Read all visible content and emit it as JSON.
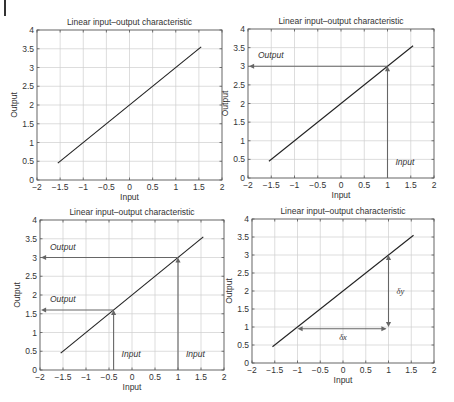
{
  "chart_data": [
    {
      "type": "line",
      "title": "Linear input–output characteristic",
      "xlabel": "Input",
      "ylabel": "Output",
      "xlim": [
        -2,
        2
      ],
      "ylim": [
        0,
        4
      ],
      "xticks": [
        "−2",
        "−1.5",
        "−1",
        "−0.5",
        "0",
        "0.5",
        "1",
        "1.5",
        "2"
      ],
      "yticks": [
        "0",
        "0.5",
        "1",
        "1.5",
        "2",
        "2.5",
        "3",
        "3.5",
        "4"
      ],
      "grid": true,
      "series": [
        {
          "name": "y = x + 2",
          "x": [
            -1.55,
            1.55
          ],
          "y": [
            0.45,
            3.55
          ]
        }
      ],
      "annotations": []
    },
    {
      "type": "line",
      "title": "Linear input–output characteristic",
      "xlabel": "Input",
      "ylabel": "Output",
      "xlim": [
        -2,
        2
      ],
      "ylim": [
        0,
        4
      ],
      "xticks": [
        "−2",
        "−1.5",
        "−1",
        "−0.5",
        "0",
        "0.5",
        "1",
        "1.5",
        "2"
      ],
      "yticks": [
        "0",
        "0.5",
        "1",
        "1.5",
        "2",
        "2.5",
        "3",
        "3.5",
        "4"
      ],
      "grid": true,
      "series": [
        {
          "name": "y = x + 2",
          "x": [
            -1.55,
            1.55
          ],
          "y": [
            0.45,
            3.55
          ]
        }
      ],
      "annotations": [
        {
          "kind": "input-arrow",
          "x": 1,
          "y_to": 3,
          "label": "Input"
        },
        {
          "kind": "output-arrow",
          "x_from": 1,
          "y": 3,
          "label": "Output"
        }
      ]
    },
    {
      "type": "line",
      "title": "Linear input–output characteristic",
      "xlabel": "Input",
      "ylabel": "Output",
      "xlim": [
        -2,
        2
      ],
      "ylim": [
        0,
        4
      ],
      "xticks": [
        "−2",
        "−1.5",
        "−1",
        "−0.5",
        "0",
        "0.5",
        "1",
        "1.5",
        "2"
      ],
      "yticks": [
        "0",
        "0.5",
        "1",
        "1.5",
        "2",
        "2.5",
        "3",
        "3.5",
        "4"
      ],
      "grid": true,
      "series": [
        {
          "name": "y = x + 2",
          "x": [
            -1.55,
            1.55
          ],
          "y": [
            0.45,
            3.55
          ]
        }
      ],
      "annotations": [
        {
          "kind": "input-arrow",
          "x": 1,
          "y_to": 3,
          "label": "Input"
        },
        {
          "kind": "output-arrow",
          "x_from": 1,
          "y": 3,
          "label": "Output"
        },
        {
          "kind": "input-arrow",
          "x": -0.4,
          "y_to": 1.6,
          "label": "Input"
        },
        {
          "kind": "output-arrow",
          "x_from": -0.4,
          "y": 1.6,
          "label": "Output"
        }
      ]
    },
    {
      "type": "line",
      "title": "Linear input–output characteristic",
      "xlabel": "Input",
      "ylabel": "Output",
      "xlim": [
        -2,
        2
      ],
      "ylim": [
        0,
        4
      ],
      "xticks": [
        "−2",
        "−1.5",
        "−1",
        "−0.5",
        "0",
        "0.5",
        "1",
        "1.5",
        "2"
      ],
      "yticks": [
        "0",
        "0.5",
        "1",
        "1.5",
        "2",
        "2.5",
        "3",
        "3.5",
        "4"
      ],
      "grid": true,
      "series": [
        {
          "name": "y = x + 2",
          "x": [
            -1.55,
            1.55
          ],
          "y": [
            0.45,
            3.55
          ]
        }
      ],
      "annotations": [
        {
          "kind": "dx-arrow",
          "x_from": -1,
          "x_to": 1,
          "y": 0.95,
          "label": "δx"
        },
        {
          "kind": "dy-arrow",
          "x": 1,
          "y_from": 1,
          "y_to": 3,
          "label": "δy"
        }
      ]
    }
  ],
  "panels": [
    {
      "left": 37,
      "top": 30,
      "right": 222,
      "bottom": 180
    },
    {
      "left": 248,
      "top": 29,
      "right": 434,
      "bottom": 178
    },
    {
      "left": 40,
      "top": 220,
      "right": 224,
      "bottom": 370
    },
    {
      "left": 252,
      "top": 219,
      "right": 434,
      "bottom": 363
    }
  ]
}
